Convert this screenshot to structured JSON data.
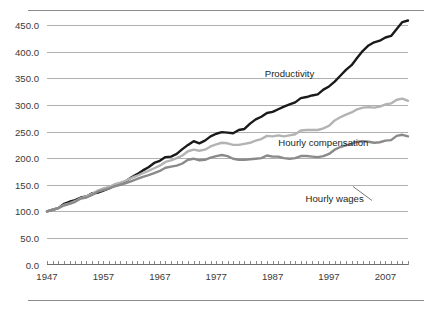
{
  "chart_data": {
    "type": "line",
    "title": "",
    "subtitle": "",
    "xlabel": "",
    "ylabel": "",
    "xlim": [
      1947,
      2011
    ],
    "ylim": [
      0.0,
      475.0
    ],
    "grid": true,
    "legend_position": "inline-annotations",
    "y_ticks": [
      "0.0",
      "50.0",
      "100.0",
      "150.0",
      "200.0",
      "250.0",
      "300.0",
      "350.0",
      "400.0",
      "450.0"
    ],
    "y_tick_values": [
      0.0,
      50.0,
      100.0,
      150.0,
      200.0,
      250.0,
      300.0,
      350.0,
      400.0,
      450.0
    ],
    "x_ticks": [
      "1947",
      "1957",
      "1967",
      "1977",
      "1987",
      "1997",
      "2007"
    ],
    "x_tick_values": [
      1947,
      1957,
      1967,
      1977,
      1987,
      1997,
      2007
    ],
    "x_minor_tick_interval": 1,
    "x": [
      1947,
      1948,
      1949,
      1950,
      1951,
      1952,
      1953,
      1954,
      1955,
      1956,
      1957,
      1958,
      1959,
      1960,
      1961,
      1962,
      1963,
      1964,
      1965,
      1966,
      1967,
      1968,
      1969,
      1970,
      1971,
      1972,
      1973,
      1974,
      1975,
      1976,
      1977,
      1978,
      1979,
      1980,
      1981,
      1982,
      1983,
      1984,
      1985,
      1986,
      1987,
      1988,
      1989,
      1990,
      1991,
      1992,
      1993,
      1994,
      1995,
      1996,
      1997,
      1998,
      1999,
      2000,
      2001,
      2002,
      2003,
      2004,
      2005,
      2006,
      2007,
      2008,
      2009,
      2010,
      2011
    ],
    "series": [
      {
        "name": "Productivity",
        "color": "#1a1a1a",
        "width": 2.4,
        "label_x": 1990,
        "label_y": 352,
        "values": [
          100,
          103,
          106,
          114,
          118,
          121,
          126,
          128,
          134,
          135,
          139,
          143,
          149,
          151,
          157,
          164,
          170,
          177,
          183,
          191,
          195,
          202,
          203,
          208,
          217,
          225,
          232,
          228,
          233,
          241,
          246,
          249,
          248,
          247,
          253,
          255,
          265,
          273,
          278,
          285,
          287,
          292,
          297,
          301,
          305,
          313,
          315,
          318,
          320,
          329,
          335,
          344,
          355,
          366,
          375,
          389,
          402,
          412,
          418,
          421,
          427,
          430,
          443,
          456,
          459
        ]
      },
      {
        "name": "Hourly compensation",
        "color": "#b3b3b3",
        "width": 2.4,
        "label_x": 1996,
        "label_y": 222,
        "values": [
          100,
          103,
          106,
          112,
          115,
          119,
          125,
          128,
          133,
          139,
          143,
          146,
          151,
          154,
          158,
          163,
          167,
          172,
          176,
          181,
          186,
          193,
          196,
          200,
          205,
          213,
          216,
          214,
          216,
          222,
          226,
          229,
          228,
          225,
          225,
          227,
          229,
          233,
          236,
          242,
          241,
          243,
          241,
          243,
          245,
          252,
          253,
          253,
          253,
          256,
          261,
          271,
          277,
          282,
          286,
          292,
          295,
          296,
          295,
          297,
          301,
          303,
          310,
          312,
          308
        ]
      },
      {
        "name": "Hourly wages",
        "color": "#8a8a8a",
        "width": 2.4,
        "label_x": 1998,
        "label_y": 118,
        "values": [
          100,
          103,
          106,
          111,
          114,
          118,
          124,
          126,
          131,
          137,
          140,
          143,
          147,
          150,
          153,
          157,
          161,
          165,
          168,
          172,
          176,
          182,
          184,
          186,
          190,
          197,
          199,
          196,
          197,
          201,
          204,
          206,
          204,
          199,
          197,
          197,
          198,
          199,
          200,
          205,
          203,
          203,
          200,
          199,
          200,
          204,
          204,
          203,
          202,
          204,
          208,
          216,
          221,
          224,
          227,
          231,
          232,
          231,
          229,
          230,
          233,
          234,
          242,
          244,
          241
        ]
      }
    ]
  }
}
